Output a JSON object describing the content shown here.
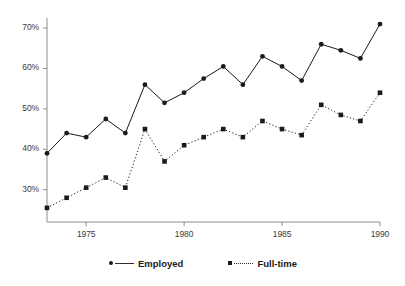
{
  "chart_data": {
    "type": "line",
    "title": "",
    "subtitle": "",
    "xlabel": "",
    "ylabel": "",
    "x": [
      1973,
      1974,
      1975,
      1976,
      1977,
      1978,
      1979,
      1980,
      1981,
      1982,
      1983,
      1984,
      1985,
      1986,
      1987,
      1988,
      1989,
      1990
    ],
    "xlim": [
      1973,
      1990
    ],
    "ylim": [
      22,
      72
    ],
    "grid": false,
    "legend_position": "bottom",
    "xticks": [
      1975,
      1980,
      1985,
      1990
    ],
    "xtick_labels": [
      "1975",
      "1980",
      "1985",
      "1990"
    ],
    "yticks": [
      30,
      40,
      50,
      60,
      70
    ],
    "ytick_labels": [
      "30%",
      "40%",
      "50%",
      "60%",
      "70%"
    ],
    "series": [
      {
        "name": "Employed",
        "line_style": "solid",
        "marker": "circle",
        "color": "#1a1a1a",
        "values": [
          39.0,
          44.0,
          43.0,
          47.5,
          44.0,
          56.0,
          51.5,
          54.0,
          57.5,
          60.5,
          56.0,
          63.0,
          60.5,
          57.0,
          66.0,
          64.5,
          62.5,
          71.0
        ]
      },
      {
        "name": "Full-time",
        "line_style": "dotted",
        "marker": "square",
        "color": "#1a1a1a",
        "values": [
          25.5,
          28.0,
          30.5,
          33.0,
          30.5,
          45.0,
          37.0,
          41.0,
          43.0,
          45.0,
          43.0,
          47.0,
          45.0,
          43.5,
          51.0,
          48.5,
          47.0,
          54.0
        ]
      }
    ]
  },
  "legend": {
    "items": [
      {
        "label": "Employed"
      },
      {
        "label": "Full-time"
      }
    ]
  },
  "axes": {
    "axis_color": "#8c8c8c",
    "tick_color": "#8c8c8c"
  }
}
